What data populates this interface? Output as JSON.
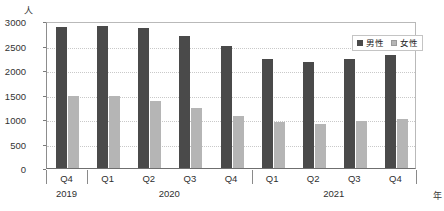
{
  "chart_data": {
    "type": "bar",
    "title": "",
    "subtitle": "",
    "xlabel": "年",
    "ylabel": "人",
    "ylim": [
      0,
      3000
    ],
    "yticks": [
      0,
      500,
      1000,
      1500,
      2000,
      2500,
      3000
    ],
    "grid": true,
    "legend_position": "top-right",
    "categories": [
      "Q4",
      "Q1",
      "Q2",
      "Q3",
      "Q4",
      "Q1",
      "Q2",
      "Q3",
      "Q4"
    ],
    "group_labels": [
      "2019",
      "2020",
      "2021"
    ],
    "group_spans": [
      1,
      4,
      4
    ],
    "series": [
      {
        "name": "男性",
        "color": "#4a4a4a",
        "values": [
          2870,
          2900,
          2850,
          2700,
          2490,
          2215,
          2170,
          2225,
          2310
        ]
      },
      {
        "name": "女性",
        "color": "#b5b5b5",
        "values": [
          1470,
          1465,
          1375,
          1215,
          1065,
          945,
          890,
          950,
          995
        ]
      }
    ]
  },
  "axis": {
    "y_unit": "人",
    "x_unit": "年",
    "y_tick_labels": [
      "3000",
      "2500",
      "2000",
      "1500",
      "1000",
      "500",
      "0"
    ]
  },
  "legend": {
    "items": [
      {
        "label": "男性"
      },
      {
        "label": "女性"
      }
    ]
  }
}
